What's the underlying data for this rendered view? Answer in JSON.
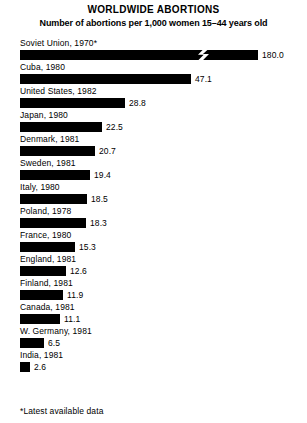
{
  "chart_data": {
    "type": "bar",
    "title": "WORLDWIDE ABORTIONS",
    "subtitle": "Number of abortions per 1,000 women 15–44 years old",
    "xlabel": "",
    "ylabel": "",
    "orientation": "horizontal",
    "grid": false,
    "legend": null,
    "xlim": [
      0,
      180
    ],
    "scale_px_per_unit": 3.63,
    "axis_break": {
      "present": true,
      "on_category": "Soviet Union, 1970*",
      "symbol": "zigzag",
      "position_px": 178
    },
    "footnote": "*Latest available data",
    "categories": [
      "Soviet Union, 1970*",
      "Cuba, 1980",
      "United States, 1982",
      "Japan, 1980",
      "Denmark, 1981",
      "Sweden, 1981",
      "Italy, 1980",
      "Poland, 1978",
      "France, 1980",
      "England, 1981",
      "Finland, 1981",
      "Canada, 1981",
      "W. Germany, 1981",
      "India, 1981"
    ],
    "values": [
      180.0,
      47.1,
      28.8,
      22.5,
      20.7,
      19.4,
      18.5,
      18.3,
      15.3,
      12.6,
      11.9,
      11.1,
      6.5,
      2.6
    ],
    "value_labels": [
      "180.0",
      "47.1",
      "28.8",
      "22.5",
      "20.7",
      "19.4",
      "18.5",
      "18.3",
      "15.3",
      "12.6",
      "11.9",
      "11.1",
      "6.5",
      "2.6"
    ],
    "bar_pixel_widths": [
      238,
      171,
      105,
      82,
      75,
      70,
      67,
      66,
      55,
      46,
      43,
      40,
      24,
      10
    ],
    "bar_color": "#000000",
    "background_color": "#ffffff",
    "bars": [
      {
        "label": "Soviet Union, 1970*",
        "value": 180.0,
        "value_label": "180.0",
        "width_px": 238,
        "broken": true
      },
      {
        "label": "Cuba, 1980",
        "value": 47.1,
        "value_label": "47.1",
        "width_px": 171,
        "broken": false
      },
      {
        "label": "United States, 1982",
        "value": 28.8,
        "value_label": "28.8",
        "width_px": 105,
        "broken": false
      },
      {
        "label": "Japan, 1980",
        "value": 22.5,
        "value_label": "22.5",
        "width_px": 82,
        "broken": false
      },
      {
        "label": "Denmark, 1981",
        "value": 20.7,
        "value_label": "20.7",
        "width_px": 75,
        "broken": false
      },
      {
        "label": "Sweden, 1981",
        "value": 19.4,
        "value_label": "19.4",
        "width_px": 70,
        "broken": false
      },
      {
        "label": "Italy, 1980",
        "value": 18.5,
        "value_label": "18.5",
        "width_px": 67,
        "broken": false
      },
      {
        "label": "Poland, 1978",
        "value": 18.3,
        "value_label": "18.3",
        "width_px": 66,
        "broken": false
      },
      {
        "label": "France, 1980",
        "value": 15.3,
        "value_label": "15.3",
        "width_px": 55,
        "broken": false
      },
      {
        "label": "England, 1981",
        "value": 12.6,
        "value_label": "12.6",
        "width_px": 46,
        "broken": false
      },
      {
        "label": "Finland, 1981",
        "value": 11.9,
        "value_label": "11.9",
        "width_px": 43,
        "broken": false
      },
      {
        "label": "Canada, 1981",
        "value": 11.1,
        "value_label": "11.1",
        "width_px": 40,
        "broken": false
      },
      {
        "label": "W. Germany, 1981",
        "value": 6.5,
        "value_label": "6.5",
        "width_px": 24,
        "broken": false
      },
      {
        "label": "India, 1981",
        "value": 2.6,
        "value_label": "2.6",
        "width_px": 10,
        "broken": false
      }
    ]
  }
}
